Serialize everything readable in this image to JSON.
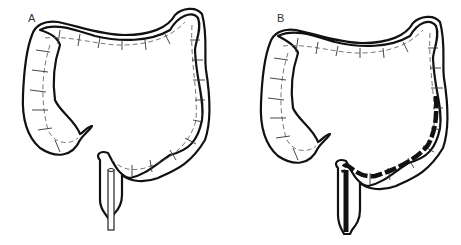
{
  "figure": {
    "panels": [
      {
        "label": "A",
        "description": "Colon with straight rigid sigmoidoscope inserted at rectum"
      },
      {
        "label": "B",
        "description": "Colon with flexible colonoscope advanced through sigmoid and descending colon"
      }
    ],
    "colors": {
      "outline": "#111111",
      "background": "#ffffff",
      "scope": "#111111"
    }
  }
}
